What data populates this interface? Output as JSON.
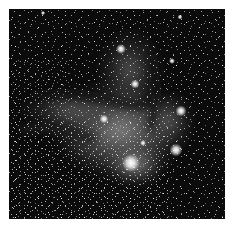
{
  "image": {
    "subject": "Grayscale astronomical photograph of a star field with diffuse nebula and dark dust lanes",
    "alt": "Star field with nebula",
    "background_color": "#0a0a0a",
    "nebula_color": "#8c8c8c",
    "star_color": "#ffffff"
  },
  "bright_stars": [
    {
      "x": 121,
      "y": 49,
      "r": 2.5
    },
    {
      "x": 135,
      "y": 84,
      "r": 2.2
    },
    {
      "x": 104,
      "y": 119,
      "r": 2.2
    },
    {
      "x": 172,
      "y": 61,
      "r": 1.6
    },
    {
      "x": 181,
      "y": 111,
      "r": 2.8
    },
    {
      "x": 176,
      "y": 150,
      "r": 3.2
    },
    {
      "x": 131,
      "y": 163,
      "r": 4.5
    },
    {
      "x": 143,
      "y": 143,
      "r": 1.5
    },
    {
      "x": 180,
      "y": 17,
      "r": 1.3
    },
    {
      "x": 43,
      "y": 13,
      "r": 1.2
    }
  ]
}
